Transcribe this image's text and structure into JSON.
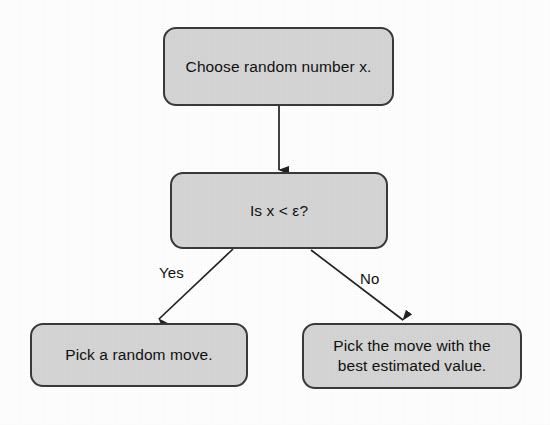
{
  "diagram": {
    "style": {
      "node_fill": "#d5d5d5",
      "node_border": "#3a3a3a",
      "text_color": "#111111",
      "arrow_color": "#222222",
      "background": "#ffffff"
    },
    "nodes": [
      {
        "id": "choose",
        "text": "Choose random number x."
      },
      {
        "id": "condition",
        "text": "Is x < ε?"
      },
      {
        "id": "random_move",
        "text": "Pick a random move."
      },
      {
        "id": "best_move",
        "text": "Pick the move with the\nbest estimated value."
      }
    ],
    "edges": [
      {
        "id": "choose-to-condition",
        "from": "choose",
        "to": "condition",
        "label": ""
      },
      {
        "id": "condition-to-random-move",
        "from": "condition",
        "to": "random_move",
        "label": "Yes"
      },
      {
        "id": "condition-to-best-move",
        "from": "condition",
        "to": "best_move",
        "label": "No"
      }
    ]
  }
}
